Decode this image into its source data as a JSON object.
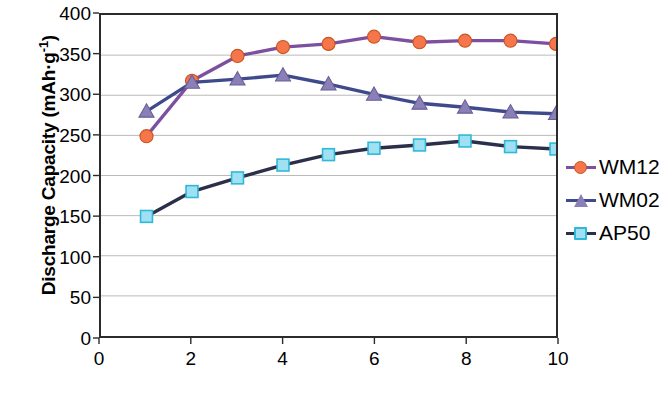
{
  "chart_data": {
    "type": "line",
    "title": "",
    "xlabel_primary": "Cycle",
    "xlabel_secondary": "Number",
    "ylabel": "Discharge Capacity (mAh·g",
    "ylabel_sup": "-1",
    "ylabel_close": ")",
    "x": [
      1,
      2,
      3,
      4,
      5,
      6,
      7,
      8,
      9,
      10
    ],
    "xlim": [
      0,
      10
    ],
    "ylim": [
      0,
      400
    ],
    "xticks": [
      0,
      2,
      4,
      6,
      8,
      10
    ],
    "yticks": [
      0,
      50,
      100,
      150,
      200,
      250,
      300,
      350,
      400
    ],
    "grid": "horizontal",
    "legend_position": "right-outside",
    "series": [
      {
        "name": "WM12",
        "values": [
          249,
          318,
          349,
          360,
          364,
          373,
          366,
          368,
          368,
          364
        ],
        "marker": "circle",
        "marker_color": "#f4764a",
        "marker_edge": "#c9541f",
        "line_color": "#7d4fa0"
      },
      {
        "name": "WM02",
        "values": [
          280,
          316,
          320,
          325,
          314,
          301,
          290,
          285,
          279,
          277
        ],
        "marker": "triangle",
        "marker_color": "#8b7fb8",
        "marker_edge": "#6a5f96",
        "line_color": "#3f4a8c"
      },
      {
        "name": "AP50",
        "values": [
          149,
          180,
          197,
          213,
          226,
          234,
          238,
          243,
          236,
          233
        ],
        "marker": "square",
        "marker_color": "#9fe0f2",
        "marker_edge": "#2fb8d8",
        "line_color": "#2b2f4a"
      }
    ]
  },
  "legend": {
    "items": [
      {
        "label": "WM12"
      },
      {
        "label": "WM02"
      },
      {
        "label": "AP50"
      }
    ]
  },
  "axes": {
    "ytick_labels": [
      "400",
      "350",
      "300",
      "250",
      "200",
      "150",
      "100",
      "50",
      "0"
    ],
    "xtick_labels": [
      "0",
      "2",
      "4",
      "6",
      "8",
      "10"
    ]
  }
}
